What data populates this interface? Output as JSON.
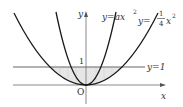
{
  "diagram": {
    "axes": {
      "x_label": "x",
      "y_label": "y",
      "origin_label": "O"
    },
    "tick_labels": {
      "y_one": "1"
    },
    "curves": [
      {
        "name": "narrow-parabola",
        "label_lhs": "y",
        "label_eq": "=",
        "label_rhs": "ax",
        "label_exp": "2"
      },
      {
        "name": "wide-parabola",
        "label_lhs": "y",
        "label_eq": "=",
        "label_num": "1",
        "label_den": "4",
        "label_rhs": "x",
        "label_exp": "2"
      }
    ],
    "line": {
      "label": "y=1"
    },
    "colors": {
      "curve": "#1a1a1a",
      "axis": "#888888",
      "line": "#666666",
      "shade": "#e3e3e3"
    }
  }
}
